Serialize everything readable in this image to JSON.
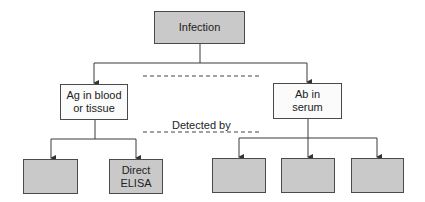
{
  "diagram": {
    "root": {
      "label": "Infection",
      "shaded": true
    },
    "branches": [
      {
        "label": "Ag in blood\nor tissue",
        "shaded": false,
        "children": [
          {
            "label": "",
            "shaded": true
          },
          {
            "label": "Direct\nELISA",
            "shaded": true
          }
        ]
      },
      {
        "label": "Ab in\nserum",
        "shaded": false,
        "children": [
          {
            "label": "",
            "shaded": true
          },
          {
            "label": "",
            "shaded": true
          },
          {
            "label": "",
            "shaded": true
          }
        ]
      }
    ],
    "connector_label": "Detected by"
  },
  "colors": {
    "shaded_fill": "#c9c9c9",
    "plain_fill": "#fbfbfb",
    "border": "#4a4a4a",
    "line": "#3a3a3a"
  }
}
